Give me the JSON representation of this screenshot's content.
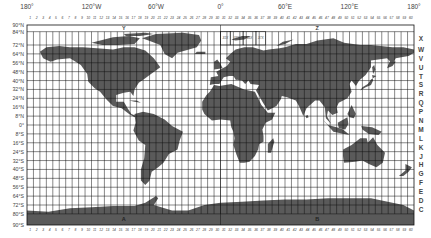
{
  "colors": {
    "land": "#5a5a5a",
    "grid": "#111111",
    "background": "#ffffff",
    "text": "#444444"
  },
  "frame": {
    "left": 27,
    "right": 414,
    "top": 25,
    "bottom": 225
  },
  "longitude_labels": [
    {
      "text": "180°",
      "lon": -180
    },
    {
      "text": "120°W",
      "lon": -120
    },
    {
      "text": "60°W",
      "lon": -60
    },
    {
      "text": "0°",
      "lon": 0
    },
    {
      "text": "60°E",
      "lon": 60
    },
    {
      "text": "120°E",
      "lon": 120
    },
    {
      "text": "180°",
      "lon": 180
    }
  ],
  "latitude_labels": [
    "90°N",
    "84°N",
    "72°N",
    "64°N",
    "56°N",
    "48°N",
    "40°N",
    "32°N",
    "24°N",
    "16°N",
    "8°N",
    "0°",
    "8°S",
    "16°S",
    "24°S",
    "32°S",
    "40°S",
    "48°S",
    "56°S",
    "64°S",
    "72°S",
    "80°S",
    "90°S"
  ],
  "latitude_values": [
    90,
    84,
    72,
    64,
    56,
    48,
    40,
    32,
    24,
    16,
    8,
    0,
    -8,
    -16,
    -24,
    -32,
    -40,
    -48,
    -56,
    -64,
    -72,
    -80,
    -90
  ],
  "band_letters": [
    {
      "letter": "X",
      "top": 84,
      "bottom": 72
    },
    {
      "letter": "W",
      "top": 72,
      "bottom": 64
    },
    {
      "letter": "V",
      "top": 64,
      "bottom": 56
    },
    {
      "letter": "U",
      "top": 56,
      "bottom": 48
    },
    {
      "letter": "T",
      "top": 48,
      "bottom": 40
    },
    {
      "letter": "S",
      "top": 40,
      "bottom": 32
    },
    {
      "letter": "R",
      "top": 32,
      "bottom": 24
    },
    {
      "letter": "Q",
      "top": 24,
      "bottom": 16
    },
    {
      "letter": "P",
      "top": 16,
      "bottom": 8
    },
    {
      "letter": "N",
      "top": 8,
      "bottom": 0
    },
    {
      "letter": "M",
      "top": 0,
      "bottom": -8
    },
    {
      "letter": "L",
      "top": -8,
      "bottom": -16
    },
    {
      "letter": "K",
      "top": -16,
      "bottom": -24
    },
    {
      "letter": "J",
      "top": -24,
      "bottom": -32
    },
    {
      "letter": "H",
      "top": -32,
      "bottom": -40
    },
    {
      "letter": "G",
      "top": -40,
      "bottom": -48
    },
    {
      "letter": "F",
      "top": -48,
      "bottom": -56
    },
    {
      "letter": "E",
      "top": -56,
      "bottom": -64
    },
    {
      "letter": "D",
      "top": -64,
      "bottom": -72
    },
    {
      "letter": "C",
      "top": -72,
      "bottom": -80
    }
  ],
  "zone_count": 60,
  "polar_labels": [
    {
      "text": "Y",
      "lon": -90,
      "lat": 87
    },
    {
      "text": "Z",
      "lon": 90,
      "lat": 87
    },
    {
      "text": "A",
      "lon": -90,
      "lat": -85
    },
    {
      "text": "B",
      "lon": 90,
      "lat": -85
    }
  ],
  "special_zones": [
    {
      "text": "31X",
      "lon": 4.5,
      "lat": 78
    },
    {
      "text": "33X",
      "lon": 15,
      "lat": 78
    },
    {
      "text": "35X",
      "lon": 27,
      "lat": 78
    },
    {
      "text": "37X",
      "lon": 37.5,
      "lat": 78
    }
  ]
}
